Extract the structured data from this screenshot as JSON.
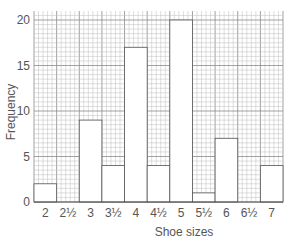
{
  "chart_data": {
    "type": "bar",
    "title": "",
    "xlabel": "Shoe sizes",
    "ylabel": "Frequency",
    "categories": [
      "2",
      "2½",
      "3",
      "3½",
      "4",
      "4½",
      "5",
      "5½",
      "6",
      "6½",
      "7"
    ],
    "values": [
      2,
      0,
      9,
      4,
      17,
      4,
      20,
      1,
      7,
      0,
      4
    ],
    "ylim": [
      0,
      20
    ],
    "yticks": [
      0,
      5,
      10,
      15,
      20
    ],
    "grid": true,
    "grid_style": "graph paper (1 unit squares, 5-unit heavier lines)",
    "legend": null
  },
  "colors": {
    "bar_fill": "#ffffff",
    "bar_edge": "#555555",
    "grid_minor": "#bdbdbd",
    "grid_major": "#8a8a8a",
    "text": "#555555"
  }
}
